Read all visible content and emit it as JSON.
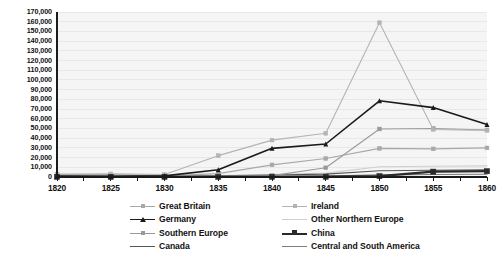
{
  "chart_data": {
    "type": "line",
    "title": "",
    "subtitle": "",
    "xlabel": "",
    "ylabel": "",
    "x": [
      1820,
      1825,
      1830,
      1835,
      1840,
      1845,
      1850,
      1855,
      1860
    ],
    "xticklabels": [
      "1820",
      "1825",
      "1830",
      "1835",
      "1840",
      "1845",
      "1850",
      "1855",
      "1860"
    ],
    "yticklabels": [
      "0",
      "10,000",
      "20,000",
      "30,000",
      "40,000",
      "50,000",
      "60,000",
      "70,000",
      "80,000",
      "90,000",
      "100,000",
      "110,000",
      "120,000",
      "130,000",
      "140,000",
      "150,000",
      "160,000",
      "170,000"
    ],
    "yticks": [
      0,
      10000,
      20000,
      30000,
      40000,
      50000,
      60000,
      70000,
      80000,
      90000,
      100000,
      110000,
      120000,
      130000,
      140000,
      150000,
      160000,
      170000
    ],
    "ylim": [
      0,
      170000
    ],
    "xlim": [
      1820,
      1860
    ],
    "grid": "horizontal",
    "legend_position": "bottom",
    "legend_columns": 2,
    "plot_background": "#f5f5f5",
    "series": [
      {
        "name": "Great Britain",
        "color": "#a8a8a8",
        "marker": "square",
        "width": 1.1,
        "values": [
          2500,
          2500,
          1200,
          3500,
          12500,
          19000,
          29500,
          29000,
          30000
        ]
      },
      {
        "name": "Ireland",
        "color": "#b4b4b4",
        "marker": "square",
        "width": 1.1,
        "values": [
          3000,
          3200,
          2500,
          22000,
          38000,
          45000,
          159000,
          49000,
          48000
        ]
      },
      {
        "name": "Germany",
        "color": "#1a1a1a",
        "marker": "triangle",
        "width": 1.6,
        "values": [
          1000,
          800,
          1200,
          7500,
          29500,
          34000,
          78500,
          71500,
          54000
        ]
      },
      {
        "name": "Other Northern Europe",
        "color": "#cfcfcf",
        "marker": "none",
        "width": 1.1,
        "values": [
          400,
          400,
          400,
          1500,
          2500,
          4000,
          10500,
          11000,
          11500
        ]
      },
      {
        "name": "Southern Europe",
        "color": "#9a9a9a",
        "marker": "square",
        "width": 1.1,
        "values": [
          300,
          300,
          300,
          900,
          1400,
          9500,
          49500,
          50000,
          48500
        ]
      },
      {
        "name": "China",
        "color": "#2a2a2a",
        "marker": "square",
        "width": 2.2,
        "values": [
          100,
          100,
          100,
          150,
          200,
          300,
          900,
          5500,
          6000
        ]
      },
      {
        "name": "Canada",
        "color": "#555555",
        "marker": "none",
        "width": 1.1,
        "values": [
          600,
          600,
          600,
          1200,
          2000,
          3000,
          6500,
          7000,
          7500
        ]
      },
      {
        "name": "Central and South America",
        "color": "#7d7d7d",
        "marker": "none",
        "width": 1.1,
        "values": [
          200,
          200,
          200,
          400,
          700,
          1100,
          2200,
          2600,
          2800
        ]
      }
    ]
  },
  "legend": {
    "entries": [
      {
        "label": "Great Britain",
        "series_index": 0,
        "col": 0,
        "row": 0
      },
      {
        "label": "Ireland",
        "series_index": 1,
        "col": 1,
        "row": 0
      },
      {
        "label": "Germany",
        "series_index": 2,
        "col": 0,
        "row": 1
      },
      {
        "label": "Other Northern Europe",
        "series_index": 3,
        "col": 1,
        "row": 1
      },
      {
        "label": "Southern Europe",
        "series_index": 4,
        "col": 0,
        "row": 2
      },
      {
        "label": "China",
        "series_index": 5,
        "col": 1,
        "row": 2
      },
      {
        "label": "Canada",
        "series_index": 6,
        "col": 0,
        "row": 3
      },
      {
        "label": "Central and South America",
        "series_index": 7,
        "col": 1,
        "row": 3
      }
    ]
  },
  "axis": {
    "axis_color": "#1a1a1a",
    "gridline_color": "#e8e8e8",
    "tick_color": "#1a1a1a"
  }
}
